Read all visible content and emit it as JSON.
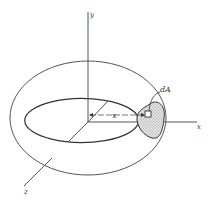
{
  "figure": {
    "labels": {
      "y_axis": "y",
      "x_axis": "x",
      "z_axis": "z",
      "area_element": "dA",
      "distance": "x"
    },
    "colors": {
      "line": "#555555",
      "shade": "#cfcfcf",
      "background": "#ffffff"
    }
  }
}
